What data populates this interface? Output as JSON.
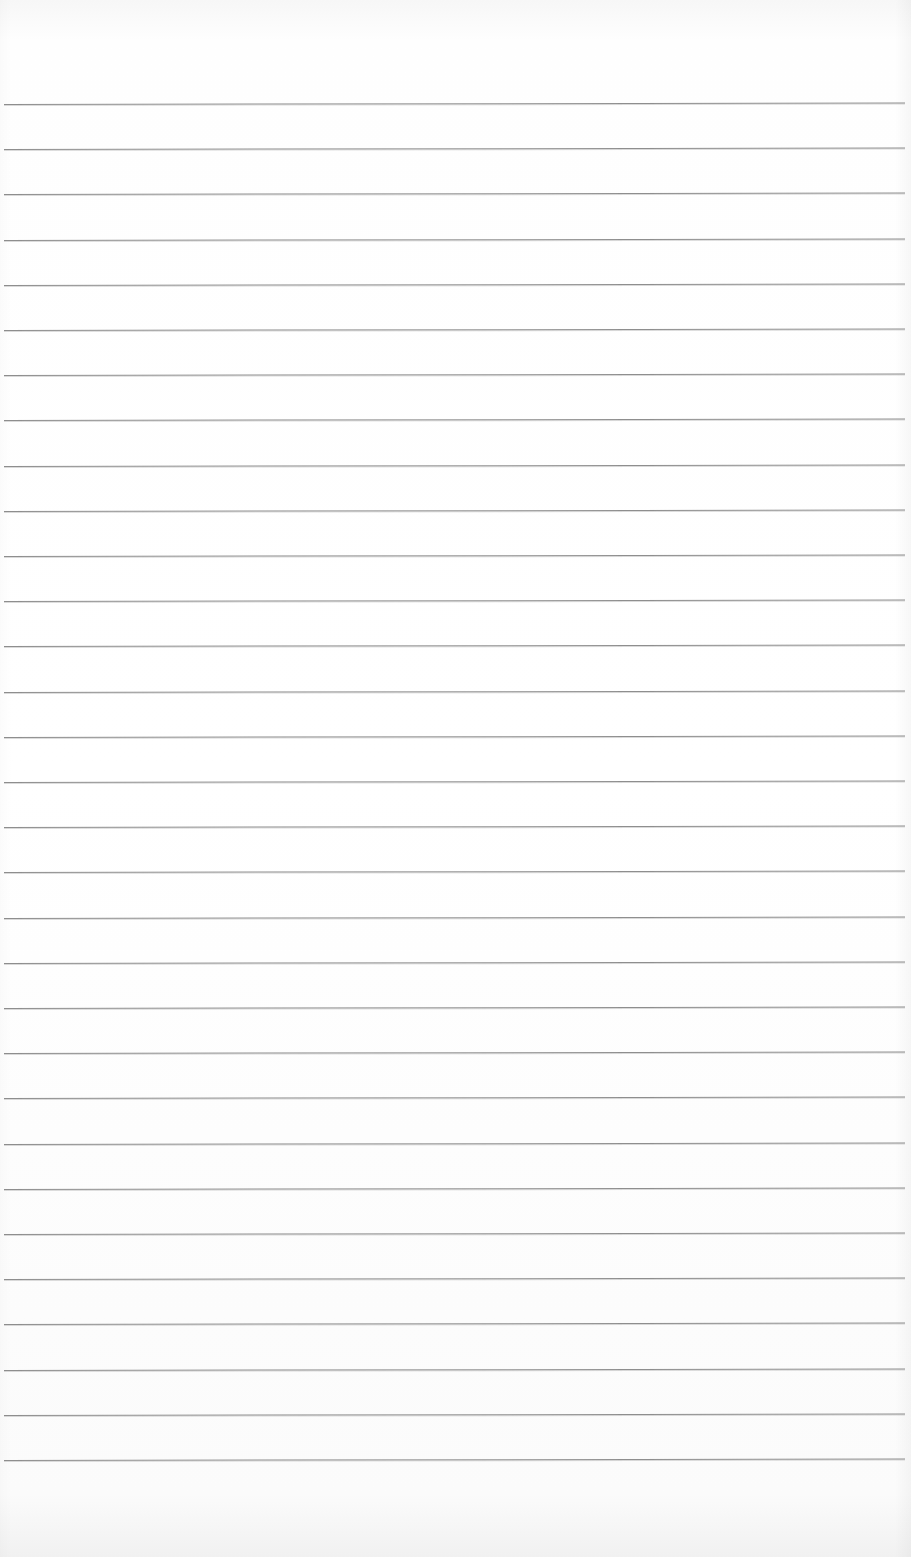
{
  "document": {
    "type": "ruled-paper",
    "text": "",
    "rules": {
      "count": 31,
      "first_y": 104,
      "spacing": 45.2,
      "color": "#8e8e8e"
    },
    "background_color": "#fdfdfd"
  }
}
